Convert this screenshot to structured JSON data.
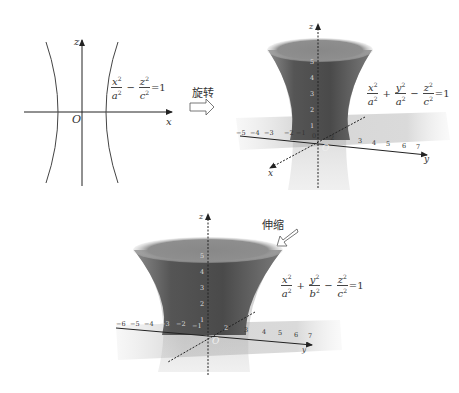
{
  "panel_2d": {
    "z_axis_label": "z",
    "x_axis_label": "x",
    "origin_label": "O",
    "equation": {
      "t1_num": "x",
      "t1_num_exp": "2",
      "t1_den": "a",
      "t1_den_exp": "2",
      "op1": "−",
      "t2_num": "z",
      "t2_num_exp": "2",
      "t2_den": "c",
      "t2_den_exp": "2",
      "rhs": "=1"
    }
  },
  "arrow_rotate": {
    "label": "旋转"
  },
  "panel_3d_rotated": {
    "z_axis_label": "z",
    "x_axis_label": "x",
    "y_axis_label": "y",
    "origin_label": "O",
    "y_ticks": [
      "−5",
      "−4",
      "−3",
      "−2",
      "−1",
      "0",
      "1",
      "2",
      "3",
      "4",
      "5",
      "6",
      "7"
    ],
    "z_ticks": [
      "1",
      "2",
      "3",
      "4",
      "5"
    ],
    "equation": {
      "t1_num": "x",
      "t1_num_exp": "2",
      "t1_den": "a",
      "t1_den_exp": "2",
      "op1": "+",
      "t2_num": "y",
      "t2_num_exp": "2",
      "t2_den": "a",
      "t2_den_exp": "2",
      "op2": "−",
      "t3_num": "z",
      "t3_num_exp": "2",
      "t3_den": "c",
      "t3_den_exp": "2",
      "rhs": "=1"
    }
  },
  "arrow_stretch": {
    "label": "伸缩"
  },
  "panel_3d_stretched": {
    "z_axis_label": "z",
    "y_axis_label": "y",
    "origin_label": "O",
    "y_ticks": [
      "−6",
      "−5",
      "−4",
      "−3",
      "−2",
      "−1",
      "0",
      "1",
      "2",
      "3",
      "4",
      "5",
      "6",
      "7"
    ],
    "z_ticks": [
      "1",
      "2",
      "3",
      "4",
      "5"
    ],
    "equation": {
      "t1_num": "x",
      "t1_num_exp": "2",
      "t1_den": "a",
      "t1_den_exp": "2",
      "op1": "+",
      "t2_num": "y",
      "t2_num_exp": "2",
      "t2_den": "b",
      "t2_den_exp": "2",
      "op2": "−",
      "t3_num": "z",
      "t3_num_exp": "2",
      "t3_den": "c",
      "t3_den_exp": "2",
      "rhs": "=1"
    }
  },
  "colors": {
    "surface_dark": "#4a4a4a",
    "surface_mid": "#6e6e6e",
    "surface_rim": "#9a9a9a",
    "plane": "#d9d9d9",
    "axis": "#333333"
  }
}
